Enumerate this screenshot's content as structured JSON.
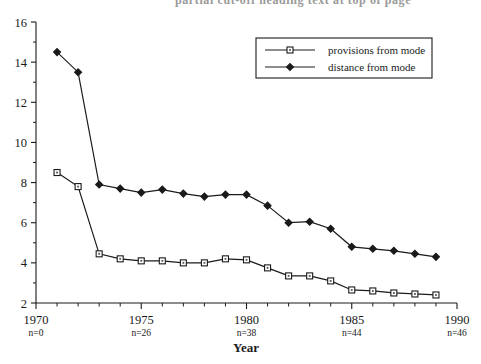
{
  "figure": {
    "clipped_heading": "partial cut-off heading text at top of page",
    "axis_title_x": "Year",
    "axis_title_y": ""
  },
  "legend": {
    "position": "top-right-inside",
    "entries": [
      {
        "label": "provisions from mode",
        "marker": "open-square",
        "color": "#1a1a1a"
      },
      {
        "label": "distance from mode",
        "marker": "filled-diamond",
        "color": "#1a1a1a"
      }
    ]
  },
  "axes": {
    "x": {
      "min": 1970,
      "max": 1990,
      "major_ticks": [
        1970,
        1975,
        1980,
        1985,
        1990
      ],
      "major_tick_labels": [
        "1970",
        "1975",
        "1980",
        "1985",
        "1990"
      ],
      "minor_tick_step": 1,
      "sub_labels": [
        "n=0",
        "n=26",
        "n=38",
        "n=44",
        "n=46"
      ]
    },
    "y": {
      "min": 2,
      "max": 16,
      "major_ticks": [
        2,
        4,
        6,
        8,
        10,
        12,
        14,
        16
      ],
      "major_tick_labels": [
        "2",
        "4",
        "6",
        "8",
        "10",
        "12",
        "14",
        "16"
      ],
      "minor_tick_step": 1
    }
  },
  "chart_data": {
    "type": "line",
    "title": "",
    "xlabel": "Year",
    "ylabel": "",
    "xlim": [
      1970,
      1990
    ],
    "ylim": [
      2,
      16
    ],
    "grid": false,
    "legend_position": "upper right",
    "x": [
      1971,
      1972,
      1973,
      1974,
      1975,
      1976,
      1977,
      1978,
      1979,
      1980,
      1981,
      1982,
      1983,
      1984,
      1985,
      1986,
      1987,
      1988,
      1989
    ],
    "series": [
      {
        "name": "distance from mode",
        "marker": "filled-diamond",
        "values": [
          14.5,
          13.5,
          7.9,
          7.7,
          7.5,
          7.65,
          7.45,
          7.3,
          7.4,
          7.4,
          6.85,
          6.0,
          6.05,
          5.7,
          4.8,
          4.7,
          4.6,
          4.45,
          4.3
        ]
      },
      {
        "name": "provisions from mode",
        "marker": "open-square",
        "values": [
          8.5,
          7.8,
          4.45,
          4.2,
          4.1,
          4.1,
          4.0,
          4.0,
          4.2,
          4.15,
          3.75,
          3.35,
          3.35,
          3.1,
          2.65,
          2.6,
          2.5,
          2.45,
          2.4
        ]
      }
    ],
    "annotations": [
      {
        "x": 1970,
        "text": "n=0"
      },
      {
        "x": 1975,
        "text": "n=26"
      },
      {
        "x": 1980,
        "text": "n=38"
      },
      {
        "x": 1985,
        "text": "n=44"
      },
      {
        "x": 1990,
        "text": "n=46"
      }
    ]
  }
}
